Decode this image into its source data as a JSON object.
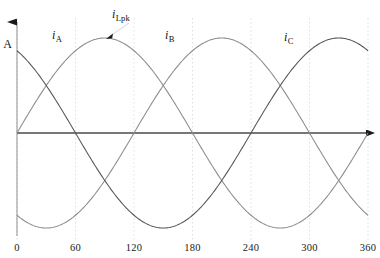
{
  "chart_data": {
    "type": "line",
    "title": "",
    "xlabel": "",
    "ylabel": "A",
    "xlim": [
      0,
      360
    ],
    "ylim": [
      -1,
      1
    ],
    "grid": true,
    "grid_axis": "x",
    "legend_position": "inline-annotations",
    "x_ticks": [
      "0",
      "60",
      "120",
      "180",
      "240",
      "300",
      "360"
    ],
    "x_tick_values": [
      0,
      60,
      120,
      180,
      240,
      300,
      360
    ],
    "y_ticks": [],
    "x_unit": "degrees",
    "series": [
      {
        "name": "i_A",
        "label": "i",
        "subscript": "A",
        "phase_deg": 0,
        "amplitude": 1,
        "peak_deg": 90,
        "color": "#8c8c8c",
        "values": [
          0,
          0.5,
          0.866,
          1,
          0.866,
          0.5,
          0,
          -0.5,
          -0.866,
          -1,
          -0.866,
          -0.5,
          0
        ]
      },
      {
        "name": "i_B",
        "label": "i",
        "subscript": "B",
        "phase_deg": -120,
        "amplitude": 1,
        "peak_deg": 210,
        "color": "#8c8c8c",
        "values": [
          -0.866,
          -1,
          -0.866,
          -0.5,
          0,
          0.5,
          0.866,
          1,
          0.866,
          0.5,
          0,
          -0.5,
          -0.866
        ]
      },
      {
        "name": "i_C",
        "label": "i",
        "subscript": "C",
        "phase_deg": 120,
        "amplitude": 1,
        "peak_deg": 330,
        "color": "#555555"
      }
    ],
    "annotations": [
      {
        "name": "peak-annotation",
        "label": "i",
        "subscript": "Lpk",
        "target_series": "i_A",
        "target_x_deg": 90,
        "target_y": 1,
        "description": "leader line pointing to peak of first sinusoid"
      }
    ]
  },
  "axes": {
    "y_axis_label": "A",
    "y_axis_arrow": "up-arrow",
    "x_axis_arrow": "right-arrow"
  },
  "labels": {
    "i_a": "i",
    "i_a_sub": "A",
    "i_b": "i",
    "i_b_sub": "B",
    "i_c": "i",
    "i_c_sub": "C",
    "i_lpk": "i",
    "i_lpk_sub": "Lpk"
  },
  "ticks": {
    "t0": "0",
    "t1": "60",
    "t2": "120",
    "t3": "180",
    "t4": "240",
    "t5": "300",
    "t6": "360"
  },
  "colors": {
    "background": "#ffffff",
    "axis": "#3a3a3a",
    "grid": "#e2dede",
    "curve_light": "#8c8c8c",
    "curve_dark": "#555555",
    "text": "#111111"
  }
}
